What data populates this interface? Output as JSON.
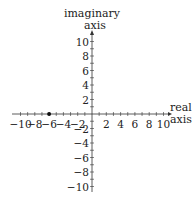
{
  "diagram": {
    "type": "complex-plane",
    "x_axis": {
      "label_line1": "real",
      "label_line2": "axis",
      "range": [
        -10,
        10
      ],
      "tick_labels": [
        "−10",
        "−8",
        "−6",
        "−4",
        "−2",
        "2",
        "4",
        "6",
        "8",
        "10"
      ],
      "tick_values": [
        -10,
        -8,
        -6,
        -4,
        -2,
        2,
        4,
        6,
        8,
        10
      ],
      "minor_step": 1
    },
    "y_axis": {
      "label_line1": "imaginary",
      "label_line2": "axis",
      "range": [
        -10,
        10
      ],
      "tick_labels": [
        "10",
        "8",
        "6",
        "4",
        "2",
        "−2",
        "−4",
        "−6",
        "−8",
        "−10"
      ],
      "tick_values": [
        10,
        8,
        6,
        4,
        2,
        -2,
        -4,
        -6,
        -8,
        -10
      ],
      "minor_step": 1
    },
    "points": [
      {
        "re": -6,
        "im": 0,
        "label": ""
      }
    ],
    "colors": {
      "axis": "#333333",
      "point": "#111111",
      "text": "#222222"
    }
  }
}
